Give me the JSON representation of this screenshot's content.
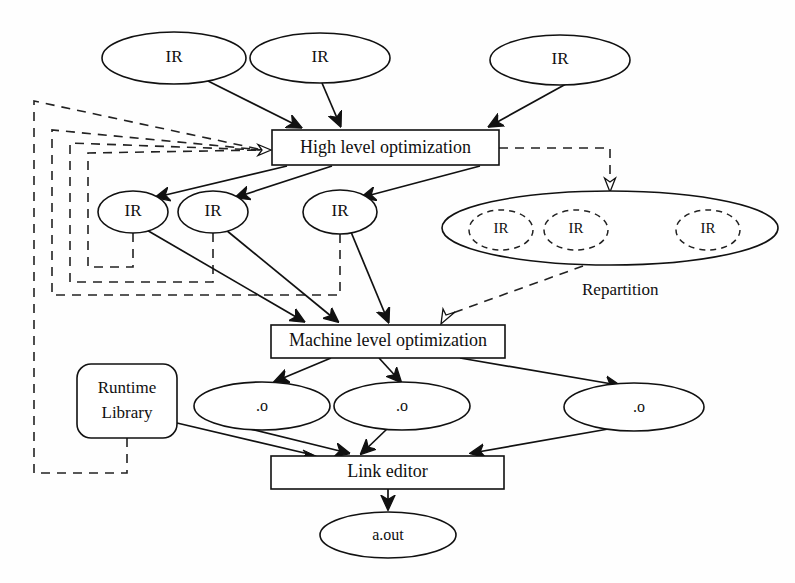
{
  "diagram": {
    "nodes": {
      "top_ir": [
        {
          "id": "ir-top-1",
          "label": "IR",
          "cx": 174,
          "cy": 58,
          "rx": 72,
          "ry": 26
        },
        {
          "id": "ir-top-2",
          "label": "IR",
          "cx": 320,
          "cy": 58,
          "rx": 70,
          "ry": 25
        },
        {
          "id": "ir-top-3",
          "label": "IR",
          "cx": 560,
          "cy": 60,
          "rx": 70,
          "ry": 25
        }
      ],
      "high_level_box": {
        "id": "high-level-optimization",
        "label": "High level optimization",
        "x": 272,
        "y": 130,
        "w": 227,
        "h": 35
      },
      "mid_ir": [
        {
          "id": "ir-mid-1",
          "label": "IR",
          "cx": 133,
          "cy": 212,
          "rx": 35,
          "ry": 21
        },
        {
          "id": "ir-mid-2",
          "label": "IR",
          "cx": 213,
          "cy": 212,
          "rx": 35,
          "ry": 21
        },
        {
          "id": "ir-mid-3",
          "label": "IR",
          "cx": 340,
          "cy": 212,
          "rx": 37,
          "ry": 22
        }
      ],
      "repartition": {
        "id": "repartition-group",
        "label": "Repartition",
        "cx": 610,
        "cy": 228,
        "rx": 168,
        "ry": 37,
        "label_x": 582,
        "label_y": 291,
        "inner": [
          {
            "id": "ir-part-1",
            "label": "IR",
            "cx": 501,
            "cy": 230,
            "rx": 32,
            "ry": 20
          },
          {
            "id": "ir-part-2",
            "label": "IR",
            "cx": 576,
            "cy": 230,
            "rx": 32,
            "ry": 20
          },
          {
            "id": "ir-part-3",
            "label": "IR",
            "cx": 708,
            "cy": 230,
            "rx": 32,
            "ry": 20
          }
        ]
      },
      "machine_level_box": {
        "id": "machine-level-optimization",
        "label": "Machine level optimization",
        "x": 271,
        "y": 325,
        "w": 234,
        "h": 33
      },
      "runtime_library": {
        "id": "runtime-library",
        "label_line1": "Runtime",
        "label_line2": "Library",
        "x": 77,
        "y": 364,
        "w": 100,
        "h": 74,
        "r": 14
      },
      "objects": [
        {
          "id": "obj-1",
          "label": ".o",
          "cx": 262,
          "cy": 406,
          "rx": 68,
          "ry": 24
        },
        {
          "id": "obj-2",
          "label": ".o",
          "cx": 402,
          "cy": 406,
          "rx": 68,
          "ry": 24
        },
        {
          "id": "obj-3",
          "label": ".o",
          "cx": 634,
          "cy": 407,
          "rx": 70,
          "ry": 24
        }
      ],
      "link_editor_box": {
        "id": "link-editor",
        "label": "Link editor",
        "x": 271,
        "y": 456,
        "w": 233,
        "h": 33
      },
      "a_out": {
        "id": "a-out",
        "label": "a.out",
        "cx": 388,
        "cy": 535,
        "rx": 68,
        "ry": 23
      }
    },
    "edges": {
      "solid": [
        {
          "from": "ir-top-1",
          "to": "high-level-optimization",
          "d": "M 206 80 L 302 128"
        },
        {
          "from": "ir-top-2",
          "to": "high-level-optimization",
          "d": "M 324 82 L 341 126"
        },
        {
          "from": "ir-top-3",
          "to": "high-level-optimization",
          "d": "M 566 84 L 489 127"
        },
        {
          "from": "high-level-optimization",
          "to": "ir-mid-1",
          "d": "M 287 166 L 158 198"
        },
        {
          "from": "high-level-optimization",
          "to": "ir-mid-2",
          "d": "M 330 166 L 238 198"
        },
        {
          "from": "high-level-optimization",
          "to": "ir-mid-3",
          "d": "M 480 166 L 364 198"
        },
        {
          "from": "ir-mid-1",
          "to": "machine-level-optimization",
          "d": "M 144 230 L 302 322"
        },
        {
          "from": "ir-mid-2",
          "to": "machine-level-optimization",
          "d": "M 226 230 L 336 322"
        },
        {
          "from": "ir-mid-3",
          "to": "machine-level-optimization",
          "d": "M 352 231 L 388 322"
        },
        {
          "from": "machine-level-optimization",
          "to": "obj-1",
          "d": "M 330 358 L 277 382"
        },
        {
          "from": "machine-level-optimization",
          "to": "obj-2",
          "d": "M 378 358 L 400 382"
        },
        {
          "from": "machine-level-optimization",
          "to": "obj-3",
          "d": "M 460 358 L 619 386"
        },
        {
          "from": "runtime-library",
          "to": "link-editor",
          "d": "M 177 423 L 311 456"
        },
        {
          "from": "obj-1",
          "to": "link-editor",
          "d": "M 244 428 L 347 454"
        },
        {
          "from": "obj-2",
          "to": "link-editor",
          "d": "M 386 428 L 360 454"
        },
        {
          "from": "obj-3",
          "to": "link-editor",
          "d": "M 615 428 L 470 454"
        },
        {
          "from": "link-editor",
          "to": "a-out",
          "d": "M 388 489 L 388 510"
        }
      ],
      "dashed_feedback": [
        {
          "from": "ir-mid-1",
          "to": "high-level-optimization",
          "d": "M 133 233 L 133 267 L 88 267 L 88 153 L 263 150"
        },
        {
          "from": "ir-mid-2",
          "to": "high-level-optimization",
          "d": "M 213 233 L 213 282 L 70 282 L 70 143 L 263 150"
        },
        {
          "from": "ir-mid-3",
          "to": "high-level-optimization",
          "d": "M 340 234 L 340 295 L 52 295 L 52 130 L 263 150"
        },
        {
          "from": "runtime-library",
          "to": "high-level-optimization",
          "d": "M 127 438 L 127 473 L 34 473 L 34 101 L 263 150"
        }
      ],
      "dashed_repartition": [
        {
          "from": "high-level-optimization",
          "to": "repartition-group",
          "d": "M 499 148 L 610 148 L 610 181"
        },
        {
          "from": "repartition-group",
          "to": "machine-level-optimization",
          "d": "M 585 265 L 443 316"
        }
      ]
    },
    "arrowheads": {
      "solid_count": 17,
      "hollow": [
        {
          "id": "hollow-arrow-high-level",
          "x": 267,
          "y": 150,
          "angle": 0
        },
        {
          "id": "hollow-arrow-repartition",
          "x": 610,
          "y": 191,
          "angle": 90
        },
        {
          "id": "hollow-arrow-machine-level",
          "x": 440,
          "y": 322,
          "angle": 205
        }
      ]
    },
    "colors": {
      "stroke": "#111111",
      "background": "#ffffff",
      "text": "#101010"
    }
  }
}
